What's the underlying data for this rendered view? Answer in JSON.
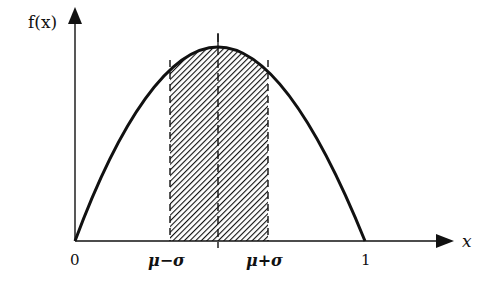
{
  "diagram": {
    "type": "probability-density-plot",
    "y_axis_label": "f(x)",
    "x_axis_label": "x",
    "tick_labels": {
      "origin": "0",
      "mu_minus_sigma": "μ−σ",
      "mu_plus_sigma": "μ+σ",
      "one": "1"
    },
    "curve": "concave-down parabola from 0 to 1 with maximum at μ",
    "shaded_region": "between μ−σ and μ+σ under the curve (hatched)",
    "center_line": "dashed vertical line at μ",
    "colors": {
      "ink": "#111111",
      "background": "#ffffff"
    }
  }
}
